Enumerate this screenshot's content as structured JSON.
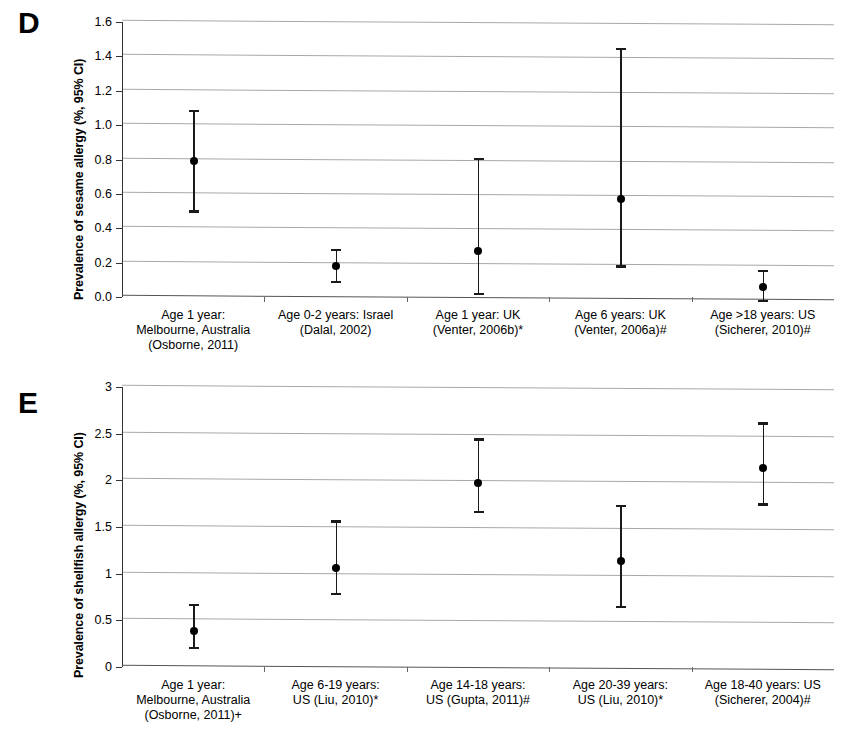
{
  "figure": {
    "panels": [
      {
        "letter": "D",
        "ylabel": "Prevalence of sesame allergy (%, 95% CI)",
        "chart_data": {
          "type": "scatter",
          "subtype": "error-bar / forest plot",
          "title": "",
          "xlabel": "",
          "ylabel": "Prevalence of sesame allergy (%, 95% CI)",
          "ylim": [
            0.0,
            1.6
          ],
          "yticks": [
            "0.0",
            "0.2",
            "0.4",
            "0.6",
            "0.8",
            "1.0",
            "1.2",
            "1.4",
            "1.6"
          ],
          "ytick_values": [
            0.0,
            0.2,
            0.4,
            0.6,
            0.8,
            1.0,
            1.2,
            1.4,
            1.6
          ],
          "grid": true,
          "legend": "none",
          "categories": [
            "Age 1 year:\nMelbourne, Australia\n(Osborne, 2011)",
            "Age 0-2 years: Israel\n(Dalal, 2002)",
            "Age 1 year: UK\n(Venter, 2006b)*",
            "Age 6 years: UK\n(Venter, 2006a)#",
            "Age >18 years: US\n(Sicherer, 2010)#"
          ],
          "values": [
            0.79,
            0.18,
            0.27,
            0.57,
            0.06
          ],
          "ci_low": [
            0.49,
            0.08,
            0.01,
            0.17,
            -0.03
          ],
          "ci_high": [
            1.09,
            0.28,
            0.81,
            1.45,
            0.16
          ]
        }
      },
      {
        "letter": "E",
        "ylabel": "Prevalence of shellfish allergy (%, 95% CI)",
        "chart_data": {
          "type": "scatter",
          "subtype": "error-bar / forest plot",
          "title": "",
          "xlabel": "",
          "ylabel": "Prevalence of shellfish allergy (%, 95% CI)",
          "ylim": [
            0,
            3
          ],
          "yticks": [
            "0",
            "0.5",
            "1",
            "1.5",
            "2",
            "2.5",
            "3"
          ],
          "ytick_values": [
            0,
            0.5,
            1,
            1.5,
            2,
            2.5,
            3
          ],
          "grid": true,
          "legend": "none",
          "categories": [
            "Age 1 year:\nMelbourne, Australia\n(Osborne, 2011)+",
            "Age 6-19 years:\nUS (Liu, 2010)*",
            "Age 14-18 years:\nUS (Gupta, 2011)#",
            "Age 20-39 years:\nUS (Liu, 2010)*",
            "Age 18-40 years: US\n(Sicherer, 2004)#"
          ],
          "values": [
            0.39,
            1.06,
            1.97,
            1.14,
            2.13
          ],
          "ci_low": [
            0.19,
            0.77,
            1.65,
            0.63,
            1.73
          ],
          "ci_high": [
            0.68,
            1.57,
            2.45,
            1.74,
            2.62
          ]
        }
      }
    ],
    "colors": {
      "marker": "#000000",
      "gridline": "#a8a8a8",
      "axis": "#333333",
      "background": "#ffffff"
    }
  }
}
